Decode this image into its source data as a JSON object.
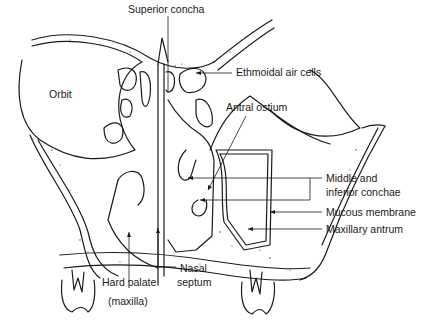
{
  "diagram": {
    "labels": {
      "superior_concha": "Superior concha",
      "ethmoidal_air_cells": "Ethmoidal air cells",
      "orbit": "Orbit",
      "antral_ostium": "Antral ostium",
      "middle_inferior_1": "Middle and",
      "middle_inferior_2": "inferior conchae",
      "mucous_membrane": "Mucous membrane",
      "maxillary_antrum": "Maxillary antrum",
      "hard_palate_1": "Hard palate",
      "hard_palate_2": "(maxilla)",
      "nasal_septum_1": "Nasal",
      "nasal_septum_2": "septum"
    },
    "colors": {
      "line": "#1a1a1a",
      "bone_fill": "#f4f4f4",
      "background": "#ffffff"
    }
  }
}
